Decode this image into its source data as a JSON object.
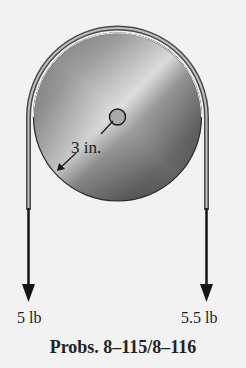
{
  "figure": {
    "type": "pulley-with-belt",
    "dimension_label": "3 in.",
    "forces": [
      {
        "side": "left",
        "label": "5 lb",
        "direction": "down"
      },
      {
        "side": "right",
        "label": "5.5 lb",
        "direction": "down"
      }
    ],
    "caption": "Probs. 8–115/8–116"
  },
  "colors": {
    "background": "#f2f2f2",
    "belt": "#555555",
    "pulley_dark": "#3a3a3a",
    "pulley_light": "#cfcfcf",
    "arrow": "#151515"
  }
}
